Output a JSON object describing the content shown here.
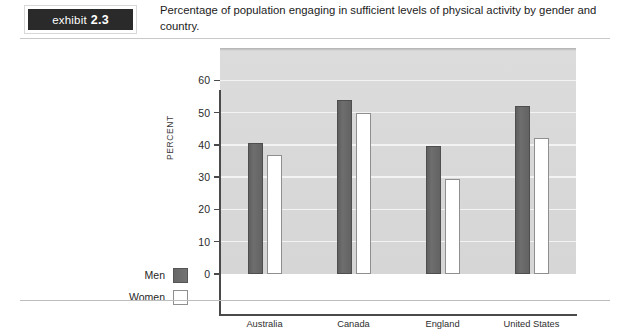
{
  "header": {
    "exhibit_word": "exhibit",
    "exhibit_number": "2.3",
    "caption": "Percentage of population engaging in sufficient levels of physical activity by gender and country."
  },
  "legend": {
    "men_label": "Men",
    "women_label": "Women"
  },
  "chart_data": {
    "type": "bar",
    "title": "Percentage of population engaging in sufficient levels of physical activity by gender and country.",
    "xlabel": "",
    "ylabel": "PERCENT",
    "ylim": [
      0,
      70
    ],
    "yticks": [
      0,
      10,
      20,
      30,
      40,
      50,
      60
    ],
    "ytick_labels": [
      "0",
      "10",
      "20",
      "30",
      "40",
      "50",
      "60"
    ],
    "grid": true,
    "legend_position": "left-outside",
    "categories": [
      "Australia",
      "Canada",
      "England",
      "United States"
    ],
    "series": [
      {
        "name": "Men",
        "color": "#6b6b6b",
        "values": [
          40.5,
          54.0,
          39.5,
          52.0
        ]
      },
      {
        "name": "Women",
        "color": "#ffffff",
        "values": [
          37.0,
          50.0,
          29.5,
          42.0
        ]
      }
    ]
  }
}
